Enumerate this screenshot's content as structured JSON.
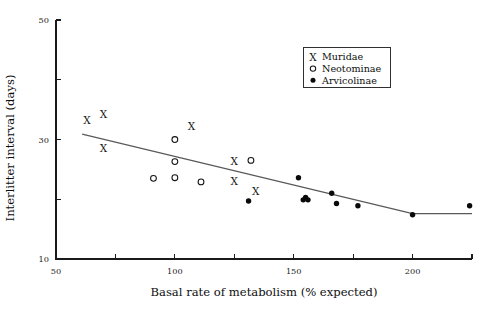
{
  "chart_data": {
    "type": "scatter",
    "title": "",
    "xlabel": "Basal rate of metabolism (% expected)",
    "ylabel": "Interlitter interval (days)",
    "xlim": [
      50,
      225
    ],
    "ylim": [
      10,
      50
    ],
    "grid": false,
    "legend_position": "top-right",
    "x_ticks": [
      50,
      75,
      100,
      125,
      150,
      175,
      200,
      225
    ],
    "x_tick_labels": [
      "50",
      "",
      "100",
      "",
      "150",
      "",
      "200",
      ""
    ],
    "y_ticks": [
      10,
      20,
      30,
      40,
      50
    ],
    "y_tick_labels": [
      "10",
      "",
      "30",
      "",
      "50"
    ],
    "series": [
      {
        "name": "Muridae",
        "marker": "x",
        "points": [
          [
            63,
            33.2
          ],
          [
            70,
            34.3
          ],
          [
            70,
            28.6
          ],
          [
            107,
            32.3
          ],
          [
            125,
            26.4
          ],
          [
            125,
            23.1
          ],
          [
            134,
            21.4
          ]
        ]
      },
      {
        "name": "Neotominae",
        "marker": "open-circle",
        "points": [
          [
            100,
            30.0
          ],
          [
            100,
            26.3
          ],
          [
            100,
            23.6
          ],
          [
            91,
            23.5
          ],
          [
            111,
            22.9
          ],
          [
            132,
            26.5
          ]
        ]
      },
      {
        "name": "Arvicolinae",
        "marker": "filled-circle",
        "points": [
          [
            131,
            19.7
          ],
          [
            152,
            23.6
          ],
          [
            154,
            19.9
          ],
          [
            155,
            20.3
          ],
          [
            156,
            19.9
          ],
          [
            166,
            21.0
          ],
          [
            168,
            19.3
          ],
          [
            177,
            18.9
          ],
          [
            200,
            17.4
          ],
          [
            224,
            18.9
          ]
        ]
      }
    ],
    "fit_line": {
      "label": "fitted trend",
      "segments": [
        [
          [
            61,
            30.9
          ],
          [
            200,
            17.6
          ]
        ],
        [
          [
            200,
            17.6
          ],
          [
            225,
            17.6
          ]
        ]
      ]
    }
  },
  "legend": {
    "entries": [
      {
        "symbol": "X",
        "label": "Muridae"
      },
      {
        "symbol": "o",
        "label": "Neotominae"
      },
      {
        "symbol": "•",
        "label": "Arvicolinae"
      }
    ]
  },
  "colors": {
    "axis": "#1a1a1a",
    "marker": "#0a0a0a",
    "fit_line": "#595959",
    "background": "#ffffff"
  }
}
